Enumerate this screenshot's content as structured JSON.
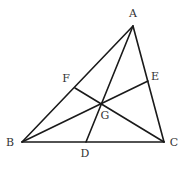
{
  "diagram": {
    "type": "triangle-medians",
    "stroke_color": "#1a1a1a",
    "label_color": "#333333",
    "points": {
      "A": {
        "label": "A",
        "x": 133,
        "y": 26,
        "lx": 133,
        "ly": 17
      },
      "B": {
        "label": "B",
        "x": 22,
        "y": 142,
        "lx": 10,
        "ly": 146
      },
      "C": {
        "label": "C",
        "x": 164,
        "y": 142,
        "lx": 174,
        "ly": 146
      },
      "D": {
        "label": "D",
        "x": 86,
        "y": 142,
        "lx": 85,
        "ly": 157
      },
      "E": {
        "label": "E",
        "x": 148,
        "y": 81,
        "lx": 155,
        "ly": 80
      },
      "F": {
        "label": "F",
        "x": 75,
        "y": 88,
        "lx": 66,
        "ly": 82
      },
      "G": {
        "label": "G",
        "x": 101,
        "y": 103,
        "lx": 105,
        "ly": 119
      }
    },
    "segments": [
      [
        "A",
        "B"
      ],
      [
        "B",
        "C"
      ],
      [
        "C",
        "A"
      ],
      [
        "A",
        "D"
      ],
      [
        "B",
        "E"
      ],
      [
        "C",
        "F"
      ]
    ]
  }
}
